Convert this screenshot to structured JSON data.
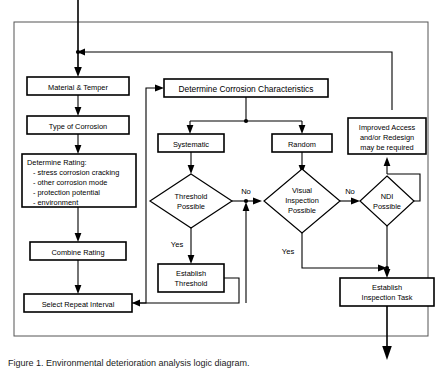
{
  "diagram": {
    "frame_label": "process-boundary",
    "colors": {
      "line": "#000000",
      "frame": "#555555",
      "box_fill": "#ffffff",
      "text": "#000000"
    },
    "nodes": {
      "material_temper": "Material & Temper",
      "type_of_corrosion": "Type of Corrosion",
      "determine_rating_title": "Determine Rating:",
      "determine_rating_items": [
        "- stress corrosion cracking",
        "- other corrosion mode",
        "- protection potential",
        "- environment"
      ],
      "combine_rating": "Combine Rating",
      "select_repeat_interval": "Select Repeat Interval",
      "determine_corrosion_characteristics": "Determine Corrosion Characteristics",
      "systematic": "Systematic",
      "random": "Random",
      "improved_access": [
        "Improved Access",
        "and/or Redesign",
        "may be required"
      ],
      "threshold_possible": [
        "Threshold",
        "Possible"
      ],
      "visual_inspection_possible": [
        "Visual",
        "Inspection",
        "Possible"
      ],
      "ndi_possible": [
        "NDI",
        "Possible"
      ],
      "establish_threshold": [
        "Establish",
        "Threshold"
      ],
      "establish_inspection_task": [
        "Establish",
        "Inspection Task"
      ]
    },
    "edge_labels": {
      "threshold_no": "No",
      "threshold_yes": "Yes",
      "visual_no": "No",
      "visual_yes": "Yes"
    },
    "caption": "Figure 1.  Environmental deterioration analysis logic diagram."
  }
}
